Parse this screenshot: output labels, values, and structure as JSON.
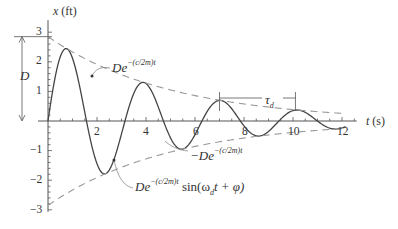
{
  "chart_data": {
    "type": "line",
    "title": "",
    "xlabel": "t (s)",
    "ylabel": "x (ft)",
    "xlim": [
      0,
      12.5
    ],
    "ylim": [
      -3,
      3
    ],
    "x_ticks": [
      2,
      4,
      6,
      8,
      10,
      12
    ],
    "y_ticks": [
      -3,
      -2,
      -1,
      1,
      2,
      3
    ],
    "grid": false,
    "legend": "none",
    "series": [
      {
        "name": "De^-(c/2m)t sin(ω_d t + φ)",
        "style": "solid",
        "D": 2.85,
        "decay": 0.2,
        "omega_d": 2.0,
        "phi": 0.0
      },
      {
        "name": "De^-(c/2m)t",
        "style": "dashed",
        "D": 2.85,
        "decay": 0.2
      },
      {
        "name": "-De^-(c/2m)t",
        "style": "dashed",
        "D": -2.85,
        "decay": 0.2
      }
    ],
    "annotations": [
      {
        "text": "D",
        "type": "dimension",
        "from_y": 0,
        "to_y": 2.85
      },
      {
        "text": "τ_d",
        "type": "dimension",
        "from_t": 7.0,
        "to_t": 10.1
      },
      {
        "text": "De^-(c/2m)t",
        "points_to": "upper envelope"
      },
      {
        "text": "-De^-(c/2m)t",
        "points_to": "lower envelope"
      },
      {
        "text": "De^-(c/2m)t sin(ω_d t + φ)",
        "points_to": "response curve"
      }
    ]
  },
  "labels": {
    "y_axis_var": "x",
    "y_axis_unit": " (ft)",
    "x_axis_var": "t",
    "x_axis_unit": " (s)",
    "D": "D",
    "tau": "τ",
    "tau_sub": "d",
    "upper_D": "De",
    "exp": "−(c/2m)t",
    "lower_D": "−De",
    "curve_D": "De",
    "curve_sin": " sin(ω",
    "curve_sin_sub": "d",
    "curve_sin_rest": "t + φ)"
  },
  "ticks": {
    "x": [
      "2",
      "4",
      "6",
      "8",
      "10",
      "12"
    ],
    "y": [
      "3",
      "2",
      "1",
      "−1",
      "−2",
      "−3"
    ]
  }
}
